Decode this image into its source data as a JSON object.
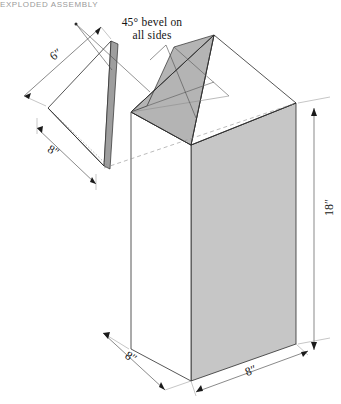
{
  "header": {
    "running_text": "EXPLODED ASSEMBLY"
  },
  "figure": {
    "callout_line1": "45° bevel on",
    "callout_line2": "all sides",
    "dimensions": {
      "bevel_slant": "6″",
      "bevel_base": "8″",
      "column_height": "18″",
      "base_depth": "8″",
      "base_width": "8″"
    },
    "colors": {
      "body_face_gray": "#c6c6c6",
      "cap_face_gray": "#b4b4b4",
      "bevel_edge_gray": "#9e9e9e",
      "line": "#2b2b2b",
      "construction_line": "#8d8d8d",
      "paper": "#ffffff"
    }
  }
}
